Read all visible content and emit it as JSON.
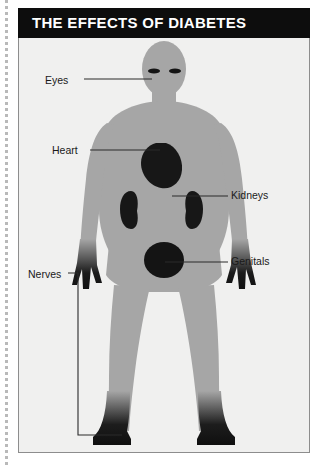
{
  "page": {
    "width": 321,
    "height": 467,
    "background": "#ffffff",
    "perforation": "dotted-tear-line"
  },
  "panel": {
    "border_color": "#8d8d8d",
    "background": "#f0f0ef"
  },
  "header": {
    "title": "THE EFFECTS OF DIABETES",
    "background": "#0d0d0d",
    "text_color": "#ffffff"
  },
  "diagram": {
    "type": "human-body-anatomical-callout",
    "body_color": "#a6a6a6",
    "organ_color": "#1a1a1a",
    "extremity_color": "#111111",
    "leader_line_color": "#2b2b2b"
  },
  "callouts": [
    {
      "id": "eyes",
      "label": "Eyes",
      "side": "left",
      "target": "eye-marks",
      "label_x": 45,
      "label_y": 74
    },
    {
      "id": "heart",
      "label": "Heart",
      "side": "left",
      "target": "heart-organ",
      "label_x": 52,
      "label_y": 144
    },
    {
      "id": "kidneys",
      "label": "Kidneys",
      "side": "right",
      "target": "kidney-organ-right",
      "label_x": 231,
      "label_y": 189
    },
    {
      "id": "genitals",
      "label": "Genitals",
      "side": "right",
      "target": "genital-region",
      "label_x": 231,
      "label_y": 255
    },
    {
      "id": "nerves",
      "label": "Nerves",
      "side": "left",
      "target": "extremities-bracket",
      "label_x": 28,
      "label_y": 268,
      "connector": "bracket"
    }
  ],
  "body_parts": [
    {
      "name": "head",
      "shade": "body"
    },
    {
      "name": "eyes",
      "shade": "organ"
    },
    {
      "name": "neck",
      "shade": "body"
    },
    {
      "name": "torso",
      "shade": "body"
    },
    {
      "name": "heart",
      "shade": "organ"
    },
    {
      "name": "kidney-left",
      "shade": "organ"
    },
    {
      "name": "kidney-right",
      "shade": "organ"
    },
    {
      "name": "genitals",
      "shade": "organ"
    },
    {
      "name": "arm-left",
      "shade": "body"
    },
    {
      "name": "arm-right",
      "shade": "body"
    },
    {
      "name": "hand-left",
      "shade": "extremity-gradient"
    },
    {
      "name": "hand-right",
      "shade": "extremity-gradient"
    },
    {
      "name": "leg-left",
      "shade": "body"
    },
    {
      "name": "leg-right",
      "shade": "body"
    },
    {
      "name": "foot-left",
      "shade": "extremity-gradient"
    },
    {
      "name": "foot-right",
      "shade": "extremity-gradient"
    }
  ]
}
